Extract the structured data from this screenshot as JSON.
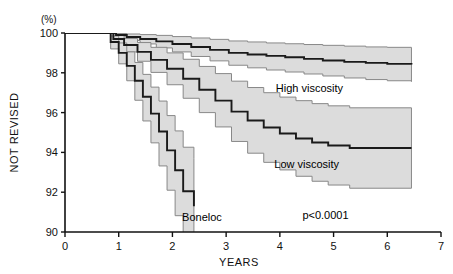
{
  "chart_data": {
    "type": "line",
    "title": "",
    "xlabel": "YEARS",
    "ylabel": "NOT REVISED",
    "yunit": "(%)",
    "xlim": [
      0,
      7
    ],
    "ylim": [
      90,
      100
    ],
    "xticks": [
      0,
      1,
      2,
      3,
      4,
      5,
      6,
      7
    ],
    "yticks": [
      90,
      92,
      94,
      96,
      98,
      100
    ],
    "xtick_labels": [
      "0",
      "1",
      "2",
      "3",
      "4",
      "5",
      "6",
      "7"
    ],
    "ytick_labels": [
      "90",
      "92",
      "94",
      "96",
      "98",
      "100"
    ],
    "grid": false,
    "legend_position": "inline-annotations",
    "annotations": [
      {
        "name": "high-viscosity",
        "text": "High viscosity",
        "x": 4.55,
        "y": 97.05
      },
      {
        "name": "low-viscosity",
        "text": "Low viscosity",
        "x": 4.5,
        "y": 93.2
      },
      {
        "name": "boneloc",
        "text": "Boneloc",
        "x": 2.55,
        "y": 90.55
      },
      {
        "name": "p-value",
        "text": "p<0.0001",
        "x": 4.85,
        "y": 90.65
      }
    ],
    "band_fill": "#dcdcdc",
    "band_edge": "#888888",
    "curve_color": "#1a1a1a",
    "series": [
      {
        "name": "High viscosity",
        "color": "#1a1a1a",
        "x": [
          0.0,
          0.75,
          0.95,
          1.15,
          1.4,
          1.7,
          2.0,
          2.35,
          2.7,
          3.05,
          3.4,
          3.75,
          4.1,
          4.45,
          4.8,
          5.2,
          5.6,
          6.0,
          6.45
        ],
        "y": [
          100.0,
          100.0,
          99.9,
          99.8,
          99.7,
          99.58,
          99.45,
          99.3,
          99.15,
          99.0,
          98.92,
          98.85,
          98.78,
          98.7,
          98.62,
          98.55,
          98.5,
          98.45,
          98.42
        ],
        "ci_upper": [
          100.0,
          100.0,
          99.98,
          99.95,
          99.92,
          99.88,
          99.82,
          99.75,
          99.68,
          99.6,
          99.55,
          99.5,
          99.46,
          99.42,
          99.38,
          99.34,
          99.3,
          99.28,
          99.26
        ],
        "ci_lower": [
          100.0,
          100.0,
          99.8,
          99.62,
          99.45,
          99.25,
          99.05,
          98.82,
          98.6,
          98.38,
          98.25,
          98.14,
          98.04,
          97.94,
          97.84,
          97.74,
          97.66,
          97.6,
          97.56
        ]
      },
      {
        "name": "Low viscosity",
        "color": "#1a1a1a",
        "x": [
          0.0,
          0.7,
          0.9,
          1.1,
          1.35,
          1.6,
          1.9,
          2.2,
          2.5,
          2.8,
          3.1,
          3.4,
          3.7,
          4.0,
          4.3,
          4.6,
          4.9,
          5.3,
          6.45
        ],
        "y": [
          100.0,
          100.0,
          99.7,
          99.4,
          99.05,
          98.65,
          98.2,
          97.7,
          97.15,
          96.6,
          96.05,
          95.6,
          95.25,
          94.95,
          94.7,
          94.5,
          94.35,
          94.22,
          94.22
        ],
        "ci_upper": [
          100.0,
          100.0,
          99.9,
          99.72,
          99.52,
          99.28,
          99.0,
          98.68,
          98.32,
          97.96,
          97.58,
          97.26,
          97.0,
          96.78,
          96.6,
          96.45,
          96.34,
          96.24,
          96.24
        ],
        "ci_lower": [
          100.0,
          100.0,
          99.45,
          99.05,
          98.58,
          98.02,
          97.4,
          96.72,
          96.0,
          95.28,
          94.55,
          93.96,
          93.5,
          93.12,
          92.8,
          92.55,
          92.36,
          92.2,
          92.2
        ]
      },
      {
        "name": "Boneloc",
        "color": "#1a1a1a",
        "x": [
          0.0,
          0.7,
          0.85,
          1.0,
          1.15,
          1.3,
          1.45,
          1.6,
          1.75,
          1.9,
          2.05,
          2.2,
          2.4
        ],
        "y": [
          100.0,
          100.0,
          99.55,
          99.0,
          98.35,
          97.6,
          96.8,
          95.95,
          95.05,
          94.1,
          93.1,
          92.05,
          91.3
        ],
        "ci_upper": [
          100.0,
          100.0,
          99.85,
          99.5,
          99.05,
          98.52,
          97.92,
          97.28,
          96.58,
          95.85,
          95.08,
          94.26,
          93.7
        ],
        "ci_lower": [
          100.0,
          100.0,
          99.2,
          98.45,
          97.6,
          96.62,
          95.58,
          94.48,
          93.32,
          92.1,
          90.82,
          89.5,
          89.0
        ]
      }
    ]
  }
}
